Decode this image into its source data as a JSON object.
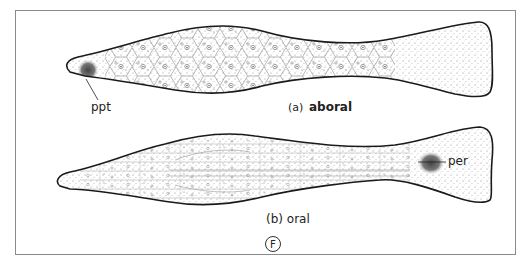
{
  "figure": {
    "letter": "F",
    "panels": [
      {
        "id": "a",
        "prefix": "(a)",
        "title": "aboral",
        "annotations": [
          {
            "label": "ppt"
          }
        ]
      },
      {
        "id": "b",
        "prefix": "(b)",
        "title": "oral",
        "annotations": [
          {
            "label": "per"
          }
        ]
      }
    ]
  },
  "colors": {
    "outline": "#1a1a1a",
    "cell_lines": "#7a7a7a",
    "stipple": "#555555",
    "frame": "#8a8a8a"
  }
}
